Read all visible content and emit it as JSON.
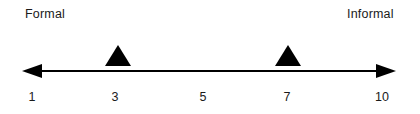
{
  "figure": {
    "name": "formality-scale",
    "background_color": "#ffffff",
    "ink_color": "#000000",
    "text_color": "#1a1a1a"
  },
  "endpoints": {
    "left_label": "Formal",
    "right_label": "Informal"
  },
  "axis": {
    "x_start": 22,
    "x_end": 396,
    "y": 71,
    "stroke_width": 2,
    "arrow_left": true,
    "arrow_right": true
  },
  "ticks": [
    {
      "label": "1",
      "x": 32
    },
    {
      "label": "3",
      "x": 115
    },
    {
      "label": "5",
      "x": 203
    },
    {
      "label": "7",
      "x": 287
    },
    {
      "label": "10",
      "x": 382
    }
  ],
  "markers": [
    {
      "name": "marker-at-3",
      "value": "3",
      "x": 118,
      "base_y": 66,
      "half_width": 13,
      "height": 21
    },
    {
      "name": "marker-at-7",
      "value": "7",
      "x": 288,
      "base_y": 66,
      "half_width": 13,
      "height": 21
    }
  ],
  "chart_data": {
    "type": "scatter",
    "title": "",
    "xlabel": "",
    "ylabel": "",
    "orientation": "horizontal",
    "scale_min": 1,
    "scale_max": 10,
    "xlim": [
      1,
      10
    ],
    "grid": false,
    "legend": null,
    "tick_labels": [
      "1",
      "3",
      "5",
      "7",
      "10"
    ],
    "tick_values": [
      1,
      3,
      5,
      7,
      10
    ],
    "anchor_labels": {
      "low": "Formal",
      "high": "Informal"
    },
    "series": [
      {
        "name": "markers",
        "marker": "triangle-up",
        "color": "#000000",
        "values": [
          3,
          7
        ]
      }
    ],
    "annotations": [
      {
        "text": "Formal",
        "position": "left-end"
      },
      {
        "text": "Informal",
        "position": "right-end"
      }
    ]
  }
}
